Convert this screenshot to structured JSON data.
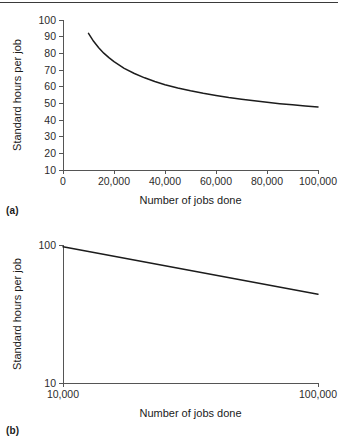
{
  "figure": {
    "panel_a_caption": "(a)",
    "panel_b_caption": "(b)"
  },
  "colors": {
    "line": "#1c1c1c",
    "axis": "#555555",
    "text": "#1a1a1a",
    "rule": "#3a3a3a",
    "background": "#ffffff"
  },
  "chart_data": [
    {
      "id": "chart-a",
      "type": "line",
      "title": "",
      "xlabel": "Number of jobs done",
      "ylabel": "Standard hours per job",
      "xscale": "linear",
      "yscale": "linear",
      "xlim": [
        0,
        100000
      ],
      "ylim": [
        10,
        100
      ],
      "grid": false,
      "legend": false,
      "xticks": [
        0,
        20000,
        40000,
        60000,
        80000,
        100000
      ],
      "xticklabels": [
        "0",
        "20,000",
        "40,000",
        "60,000",
        "80,000",
        "100,000"
      ],
      "yticks": [
        10,
        20,
        30,
        40,
        50,
        60,
        70,
        80,
        90,
        100
      ],
      "yticklabels": [
        "10",
        "20",
        "30",
        "40",
        "50",
        "60",
        "70",
        "80",
        "90",
        "100"
      ],
      "series": [
        {
          "name": "Standard hours per job",
          "x": [
            10000,
            12000,
            14000,
            16000,
            18000,
            20000,
            24000,
            28000,
            32000,
            36000,
            40000,
            45000,
            50000,
            55000,
            60000,
            65000,
            70000,
            75000,
            80000,
            85000,
            90000,
            95000,
            100000
          ],
          "y": [
            92.0,
            87.2,
            83.3,
            80.1,
            77.4,
            75.0,
            71.0,
            67.9,
            65.3,
            63.1,
            61.2,
            59.2,
            57.5,
            56.0,
            54.7,
            53.5,
            52.5,
            51.5,
            50.6,
            49.8,
            49.1,
            48.4,
            47.8
          ]
        }
      ]
    },
    {
      "id": "chart-b",
      "type": "line",
      "title": "",
      "xlabel": "Number of jobs done",
      "ylabel": "Standard hours per job",
      "xscale": "log",
      "yscale": "log",
      "xlim": [
        10000,
        100000
      ],
      "ylim": [
        10,
        100
      ],
      "grid": false,
      "legend": false,
      "xticks": [
        10000,
        100000
      ],
      "xticklabels": [
        "10,000",
        "100,000"
      ],
      "yticks": [
        10,
        100
      ],
      "yticklabels": [
        "10",
        "100"
      ],
      "series": [
        {
          "name": "Standard hours per job",
          "x": [
            10000,
            100000
          ],
          "y": [
            97.0,
            44.0
          ]
        }
      ]
    }
  ]
}
